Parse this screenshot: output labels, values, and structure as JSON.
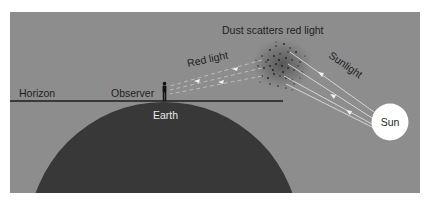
{
  "diagram": {
    "title": "Dust scatters red light",
    "labels": {
      "dust": "Dust scatters red light",
      "red_light": "Red light",
      "sunlight": "Sunlight",
      "horizon": "Horizon",
      "observer": "Observer",
      "earth": "Earth",
      "sun": "Sun"
    },
    "colors": {
      "sky": "#8d8d8d",
      "earth": "#383838",
      "sun": "#ffffff",
      "dust": "#2e2e2e",
      "rays": "#e6e6e6",
      "text_dark": "#1e1e1e",
      "text_light": "#e8e8e8"
    }
  }
}
